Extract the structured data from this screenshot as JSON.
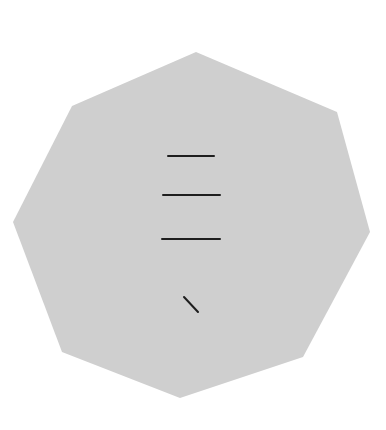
{
  "figure": {
    "shape": "octagon",
    "fill": "#cfcfcf",
    "stroke_color": "#1e1e1e",
    "background": "#ffffff",
    "vertices": [
      [
        196,
        52
      ],
      [
        337,
        112
      ],
      [
        370,
        232
      ],
      [
        303,
        357
      ],
      [
        180,
        398
      ],
      [
        62,
        352
      ],
      [
        13,
        222
      ],
      [
        72,
        106
      ]
    ],
    "marks": [
      {
        "name": "horizontal-line-1",
        "x1": 168,
        "y1": 156,
        "x2": 214,
        "y2": 156,
        "width": 2
      },
      {
        "name": "horizontal-line-2",
        "x1": 163,
        "y1": 195,
        "x2": 220,
        "y2": 195,
        "width": 2
      },
      {
        "name": "horizontal-line-3",
        "x1": 162,
        "y1": 239,
        "x2": 220,
        "y2": 239,
        "width": 2
      },
      {
        "name": "diagonal-stroke",
        "x1": 184,
        "y1": 297,
        "x2": 198,
        "y2": 312,
        "width": 2
      }
    ]
  }
}
